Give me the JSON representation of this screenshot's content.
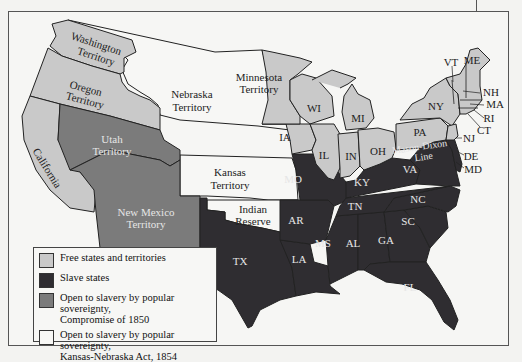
{
  "colors": {
    "free": "#c9c9c9",
    "slave": "#2f2d31",
    "compromise_1850": "#7b7b7b",
    "kansas_nebraska": "#f7f7f5",
    "border": "#222222"
  },
  "regions": {
    "washington": {
      "l1": "Washington",
      "l2": "Territory"
    },
    "oregon": {
      "l1": "Oregon",
      "l2": "Territory"
    },
    "california": "California",
    "utah": {
      "l1": "Utah",
      "l2": "Territory"
    },
    "new_mexico": {
      "l1": "New Mexico",
      "l2": "Territory"
    },
    "nebraska": {
      "l1": "Nebraska",
      "l2": "Territory"
    },
    "kansas": {
      "l1": "Kansas",
      "l2": "Territory"
    },
    "indian": {
      "l1": "Indian",
      "l2": "Reserve"
    },
    "minnesota": {
      "l1": "Minnesota",
      "l2": "Territory"
    },
    "tx": "TX",
    "la": "LA",
    "ar": "AR",
    "mo": "MO",
    "ms": "MS",
    "al": "AL",
    "ga": "GA",
    "fl": "FL",
    "sc": "SC",
    "nc": "NC",
    "tn": "TN",
    "ky": "KY",
    "va": "VA",
    "ia": "IA",
    "wi": "WI",
    "il": "IL",
    "in": "IN",
    "mi": "MI",
    "oh": "OH",
    "pa": "PA",
    "ny": "NY",
    "vt": "VT",
    "me": "ME",
    "nh": "NH",
    "ma": "MA",
    "ri": "RI",
    "ct": "CT",
    "nj": "NJ",
    "de": "DE",
    "md": "MD",
    "mason_dixon": {
      "l1": "Mason-Dixon",
      "l2": "Line"
    }
  },
  "legend": {
    "items": [
      {
        "label": "Free states and territories",
        "label2": ""
      },
      {
        "label": "Slave states",
        "label2": ""
      },
      {
        "label": "Open to slavery by popular sovereignty,",
        "label2": "Compromise of 1850"
      },
      {
        "label": "Open to slavery by popular sovereignty,",
        "label2": "Kansas-Nebraska Act, 1854"
      }
    ]
  }
}
